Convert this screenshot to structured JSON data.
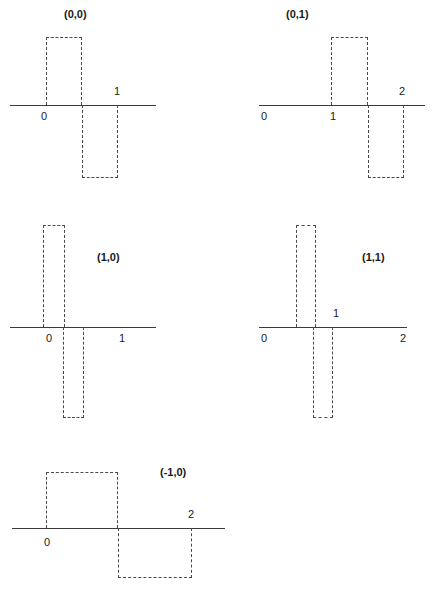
{
  "figure": {
    "type": "multi-panel-waveform-diagram",
    "width": 443,
    "height": 598,
    "line_color": "#3a3a3a",
    "dash_color": "#4a4a4a",
    "text_color": "#1a1a1a",
    "background": "#ffffff"
  },
  "panels": [
    {
      "id": "panel-0-0",
      "title": "(0,0)",
      "title_x": 64,
      "title_y": 8,
      "axis": {
        "x": 10,
        "y": 105,
        "width": 146
      },
      "ticks": [
        {
          "label": "0",
          "x": 41,
          "y": 110
        },
        {
          "label": "1",
          "x": 114,
          "y": 85
        }
      ],
      "pulses": [
        {
          "sign": "positive",
          "x": 46,
          "y": 37,
          "width": 36,
          "height": 68
        },
        {
          "sign": "negative",
          "x": 82,
          "y": 105,
          "width": 36,
          "height": 73
        }
      ]
    },
    {
      "id": "panel-0-1",
      "title": "(0,1)",
      "title_x": 286,
      "title_y": 8,
      "axis": {
        "x": 259,
        "y": 105,
        "width": 166
      },
      "ticks": [
        {
          "label": "0",
          "x": 261,
          "y": 110
        },
        {
          "label": "1",
          "x": 330,
          "y": 110
        },
        {
          "label": "2",
          "x": 399,
          "y": 85
        }
      ],
      "pulses": [
        {
          "sign": "positive",
          "x": 331,
          "y": 37,
          "width": 37,
          "height": 68
        },
        {
          "sign": "negative",
          "x": 368,
          "y": 105,
          "width": 36,
          "height": 73
        }
      ]
    },
    {
      "id": "panel-1-0",
      "title": "(1,0)",
      "title_x": 97,
      "title_y": 251,
      "axis": {
        "x": 10,
        "y": 327,
        "width": 146
      },
      "ticks": [
        {
          "label": "0",
          "x": 46,
          "y": 332
        },
        {
          "label": "1",
          "x": 119,
          "y": 332
        }
      ],
      "pulses": [
        {
          "sign": "positive",
          "x": 43,
          "y": 225,
          "width": 22,
          "height": 102
        },
        {
          "sign": "negative",
          "x": 63,
          "y": 327,
          "width": 21,
          "height": 91
        }
      ]
    },
    {
      "id": "panel-1-1",
      "title": "(1,1)",
      "title_x": 362,
      "title_y": 251,
      "axis": {
        "x": 259,
        "y": 327,
        "width": 148
      },
      "ticks": [
        {
          "label": "0",
          "x": 261,
          "y": 332
        },
        {
          "label": "1",
          "x": 333,
          "y": 307
        },
        {
          "label": "2",
          "x": 400,
          "y": 332
        }
      ],
      "pulses": [
        {
          "sign": "positive",
          "x": 296,
          "y": 225,
          "width": 20,
          "height": 102
        },
        {
          "sign": "negative",
          "x": 313,
          "y": 327,
          "width": 20,
          "height": 91
        }
      ]
    },
    {
      "id": "panel-m1-0",
      "title": "(-1,0)",
      "title_x": 160,
      "title_y": 466,
      "axis": {
        "x": 12,
        "y": 528,
        "width": 213
      },
      "ticks": [
        {
          "label": "0",
          "x": 44,
          "y": 536
        },
        {
          "label": "2",
          "x": 188,
          "y": 508
        }
      ],
      "pulses": [
        {
          "sign": "positive",
          "x": 46,
          "y": 472,
          "width": 72,
          "height": 56
        },
        {
          "sign": "negative",
          "x": 118,
          "y": 528,
          "width": 74,
          "height": 50
        }
      ]
    }
  ]
}
